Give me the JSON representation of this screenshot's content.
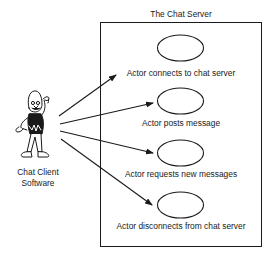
{
  "diagram": {
    "type": "uml-use-case",
    "system_boundary": {
      "title": "The Chat Server"
    },
    "actor": {
      "label_line1": "Chat Client",
      "label_line2": "Software",
      "icon": "cartoon-actor-icon"
    },
    "use_cases": [
      {
        "label": "Actor connects to chat server"
      },
      {
        "label": "Actor posts message"
      },
      {
        "label": "Actor requests new messages"
      },
      {
        "label": "Actor disconnects from chat server"
      }
    ],
    "colors": {
      "stroke": "#1a1a1a",
      "background": "#ffffff"
    }
  }
}
